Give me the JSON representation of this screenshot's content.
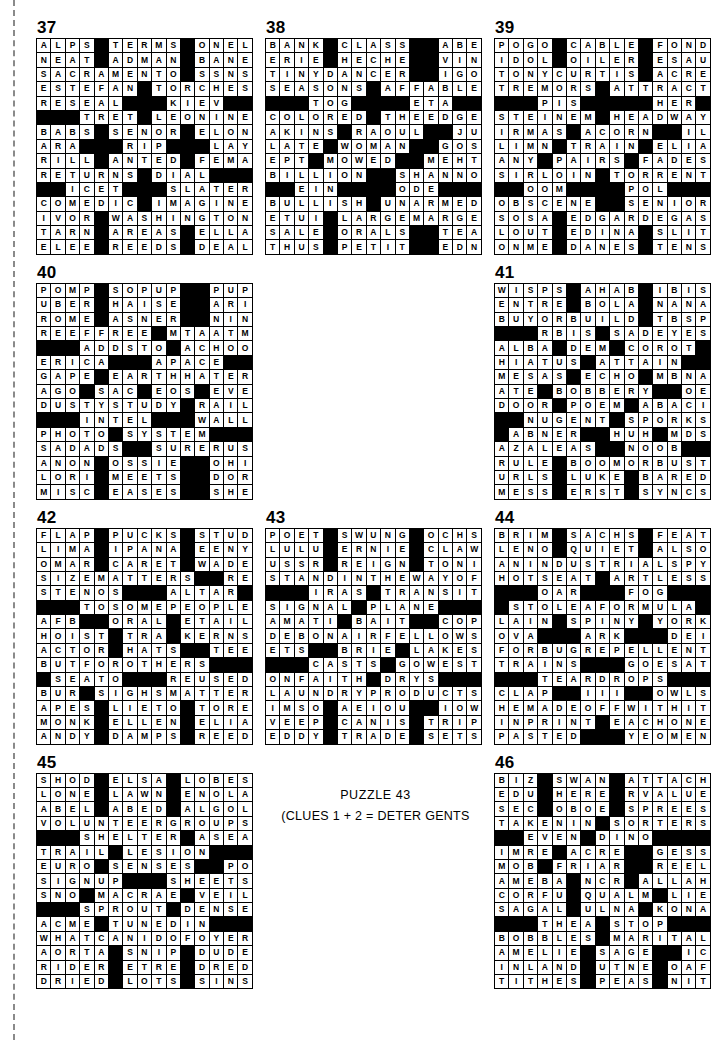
{
  "page": {
    "trim_mark": "dashed-vertical-rule"
  },
  "note": {
    "line1": "PUZZLE 43",
    "line2": "(CLUES 1 + 2 = DETER GENTS"
  },
  "colors": {
    "block": "#000000",
    "fill": "#ffffff",
    "rule": "#000000",
    "trim": "#8a8a8a"
  },
  "puzzles": [
    {
      "number": "37",
      "size": [
        15,
        15
      ],
      "grid": [
        "ALPS#TERMS#ONEL",
        "NEAT#ADMAN#BANE",
        "SACRAMENTO#SSNS",
        "ESTEFAN#TORCHES",
        "RESEAL###KIEV##",
        "###TRET#LEONINE",
        "BABS#SENOR#ELON",
        "ARA###RIP###LAY",
        "RILL#ANTED#FEMA",
        "RETURNS#DIAL###",
        "##ICET###SLATER",
        "COMEDIC#IMAGINE",
        "IVOR#WASHINGTON",
        "TARN#AREAS#ELLA",
        "ELEE#REEDS#DEAL"
      ]
    },
    {
      "number": "38",
      "size": [
        15,
        15
      ],
      "grid": [
        "BANK#CLASS##ABET",
        "ERIE#HECHE##VINO",
        "TINYDANCER##IGOT",
        "SEASONS#AFFABLE#",
        "###TOG####ETA###",
        "COLORED#THEEDGE#",
        "AKINS#RAOUL##JUT",
        "LATE#WOMAN##GOSH",
        "EPT#MOWED##MEHTA",
        "BILLION##SHANNON",
        "##EIN####ODE####",
        "BULLISH#UNARMED#",
        "ETUI#LARGEMARGE#",
        "SALE#ORALS##TEAL",
        "THUS#PETIT##EDNA"
      ]
    },
    {
      "number": "39",
      "size": [
        15,
        15
      ],
      "grid": [
        "POGO#CABLE#FOND",
        "IDOL#OILER#ESAU",
        "TONYCURTIS#ACRE",
        "TREMORS#ATTRACT",
        "###PIS#####HER#",
        "STEINEM#HEADWAY",
        "IRMAS#ACORN##ILE",
        "LIMN#TRAIN#ELIA",
        "ANY#PAIRS#FADES",
        "SIRLOIN#TORRENT",
        "##OOM####POL###",
        "OBSCENE##SENIORS",
        "SOSA#EDGARDEGAS",
        "LOUT#EDINA#SLIT",
        "ONME#DANES#TENS"
      ]
    },
    {
      "number": "40",
      "size": [
        15,
        15
      ],
      "grid": [
        "POMP#SOPUP##PUPS",
        "UBER#HAISE##ARIL",
        "ROME#ASNER##NINO",
        "REEFFREE#MTAATM",
        "###ADDSTO#ACHOO",
        "ERICA###APACE###",
        "GAPE#EARTHHATER",
        "AGO#SAC#EOS#EVE",
        "DUSTYSTUDY#RAIL",
        "###INTEL###WALLY",
        "PHOTO#SYSTEM###",
        "SADADS##SURERUSE",
        "ANON#OSSIE##OHIO",
        "LORI#MEETS##DORN",
        "MISC#EASES##SHES"
      ]
    },
    {
      "number": "41",
      "size": [
        15,
        15
      ],
      "grid": [
        "WISPS#AHAB#IBIS",
        "ENTRE#BOLA#NANA",
        "BUYORBUILD#TBSP",
        "###RBIS#SADEYES",
        "ALBA#DEM#COROT#",
        "HIATUS#ATTAIN##",
        "MESAS#ECHO#MBNA",
        "ATE#BOBBERY##OER",
        "DOOR#POEM#ABACI",
        "##NUGENT#SPORKS",
        "#ABNER##HUH#MDSE",
        "AZALEAS##NOOB##",
        "RULE#BOOMORBUST",
        "URLS#LUKE#BARED",
        "MESS#ERST#SYNCS"
      ]
    },
    {
      "number": "42",
      "size": [
        15,
        15
      ],
      "grid": [
        "FLAP#PUCKS#STUD",
        "LIMA#IPANA#EENY",
        "OMAR#CARET#WADE",
        "SIZEMATTERS##RED",
        "STENOS###ALTAR#",
        "###TOSOMEPEOPLE",
        "AFB##ORAL#ETAIL",
        "HOIST#TRA#KERNS",
        "ACTOR#HATS##TEE",
        "BUTFOROTHERS###",
        "#SEATO###REUSED",
        "BUR#SIGHSMATTER",
        "APES#LIETO#TORE",
        "MONK#ELLEN#ELIA",
        "ANDY#DAMPS#REED"
      ]
    },
    {
      "number": "43",
      "size": [
        15,
        15
      ],
      "grid": [
        "POET#SWUNG#OCHS",
        "LULU#ERNIE#CLAW",
        "USSR#REIGN#TONI",
        "STANDINTHEWAYOF",
        "###IRAS#TRANSIT",
        "SIGNAL#PLANE###",
        "AMATI#BAIT##COP",
        "DEBONAIRFELLOWS",
        "ETS##BRIE#LAKES",
        "###CASTS#GOWEST",
        "ONFAITH#DRYS###",
        "LAUNDRYPRODUCTS",
        "IMSO#AEIOU##IOWA",
        "VEEP#CANIS#TRIP",
        "EDDY#TRADE#SETS"
      ]
    },
    {
      "number": "44",
      "size": [
        15,
        15
      ],
      "grid": [
        "BRIM#SACHS#FEAT",
        "LENO#QUIET#ALSO",
        "ANINDUSTRIALSPY",
        "HOTSEAT#ARTLESS",
        "###OAR###FOG###",
        "#STOLEAFORMULA#",
        "LAIN#SPINY#YORK",
        "OVA###ARK###DEI",
        "FORBUGREPELLENT",
        "TRAINS###GOESAT",
        "###TEARDROPS###",
        "CLAP##III##OWLS",
        "HEMADEOFFWITHIT",
        "INPRINT#EACHONE",
        "PASTED###YEOMEN"
      ]
    },
    {
      "number": "45",
      "size": [
        15,
        15
      ],
      "grid": [
        "SHOD#ELSA#LOBES",
        "LONE#LAWN#ENOLA",
        "ABEL#ABED#ALGOL",
        "VOLUNTEERGROUPS",
        "###SHELTER#ASEA",
        "TRAIL#LESION###",
        "EURO#SENSES##POI",
        "SIGNUP###SHEETS",
        "SNO#MACRAE#VEIL",
        "###SPROUT#DENSE",
        "ACME#TUNEDIN###",
        "WHATCANIDOFOYER",
        "AORTA#SNIP#DUDE",
        "RIDER#ETRE#DRED",
        "DRIED#LOTS#SINS"
      ]
    },
    {
      "number": "46",
      "size": [
        15,
        15
      ],
      "grid": [
        "BIZ#SWAN#ATTACH",
        "EDU#HERE#RVALUE",
        "SEC#OBOE#SPREES",
        "TAKENIN#SORTERS",
        "##EVEN#DINO####",
        "IMRE#ACRE##GESSO",
        "MOB#FRIAR##REELS",
        "AMEBA#NCR#ALLAH",
        "CORFU#QUALM#LIE",
        "SAGAL#ULNA#KONA",
        "###THEA#STOP###",
        "BOBBLES#MARITAL",
        "AMELIE#SAGE##ICE",
        "INLAND#UTNE#OAF",
        "TITHES#PEAS#NIT"
      ]
    }
  ]
}
